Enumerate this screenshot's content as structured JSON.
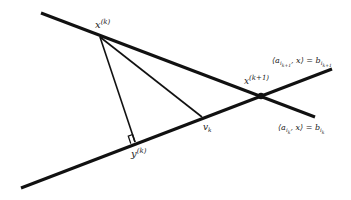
{
  "diagram": {
    "labels": {
      "xk": {
        "base": "x",
        "sup": "(k)"
      },
      "xk1": {
        "base": "x",
        "sup": "(k+1)"
      },
      "yk": {
        "base": "y",
        "sup": "(k)"
      },
      "vk": {
        "base": "v",
        "sub": "k"
      },
      "hyperplane_top": "⟨a_{i_{k+1}}, x⟩ = b_{i_{k+1}}",
      "hyperplane_top_parts": {
        "open": "⟨a",
        "sub1": "i",
        "sub2": "k+1",
        "mid": ", x⟩ = b",
        "sub3": "i",
        "sub4": "k+1"
      },
      "hyperplane_bottom": "⟨a_{i_k}, x⟩ = b_{i_k}",
      "hyperplane_bottom_parts": {
        "open": "⟨a",
        "sub1": "i",
        "sub2": "k",
        "mid": ", x⟩ = b",
        "sub3": "i",
        "sub4": "k"
      }
    },
    "points": {
      "xk": [
        100,
        37
      ],
      "xk1": [
        261,
        96
      ],
      "yk": [
        135,
        142
      ],
      "vk": [
        202,
        117
      ]
    },
    "lines": {
      "top": [
        [
          41,
          13
        ],
        [
          315,
          117
        ]
      ],
      "bottom": [
        [
          21,
          188
        ],
        [
          332,
          69
        ]
      ]
    },
    "colors": {
      "line": "#111111",
      "text": "#222222",
      "background": "#ffffff"
    }
  }
}
